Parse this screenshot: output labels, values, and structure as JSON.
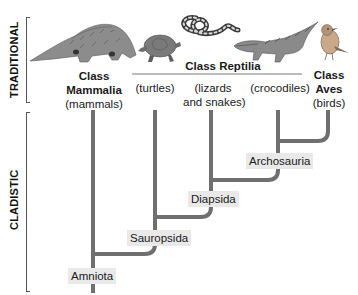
{
  "side_labels": {
    "traditional": "TRADITIONAL",
    "cladistic": "CLADISTIC"
  },
  "traditional_groups": {
    "mammalia": {
      "class_label": "Class",
      "name": "Mammalia",
      "common": "(mammals)"
    },
    "reptilia": {
      "class_label": "Class Reptilia",
      "members": [
        {
          "common": "(turtles)"
        },
        {
          "common_line1": "(lizards",
          "common_line2": "and snakes)"
        },
        {
          "common": "(crocodiles)"
        }
      ]
    },
    "aves": {
      "class_label": "Class",
      "name": "Aves",
      "common": "(birds)"
    }
  },
  "animals": [
    "pangolin",
    "turtle",
    "snake",
    "crocodile",
    "bird"
  ],
  "clades": {
    "amniota": "Amniota",
    "sauropsida": "Sauropsida",
    "diapsida": "Diapsida",
    "archosauria": "Archosauria"
  },
  "colors": {
    "tree_line": "#6f6f6f",
    "label_box": "#e9e9e9",
    "bracket": "#555555"
  }
}
